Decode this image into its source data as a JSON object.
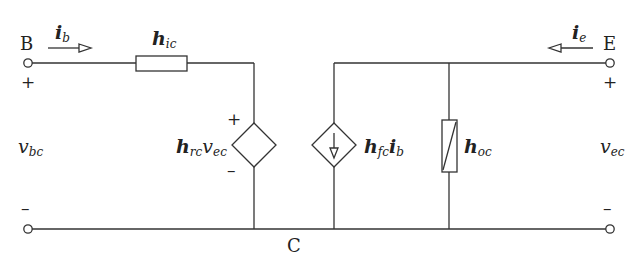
{
  "diagram": {
    "nodes": {
      "base": "B",
      "emitter": "E",
      "collector": "C"
    },
    "currents": {
      "base": {
        "symbol": "i",
        "sub": "b",
        "direction": "right"
      },
      "emitter": {
        "symbol": "i",
        "sub": "e",
        "direction": "left"
      }
    },
    "voltages": {
      "input": {
        "symbol": "v",
        "sub": "bc"
      },
      "output": {
        "symbol": "v",
        "sub": "ec"
      }
    },
    "components": {
      "input_resistance": {
        "symbol": "h",
        "sub": "ic",
        "type": "resistor"
      },
      "voltage_source": {
        "symbol": "h",
        "sub": "rc",
        "mult": "v",
        "mult_sub": "ec",
        "type": "dependent-voltage-source"
      },
      "current_source": {
        "symbol": "h",
        "sub": "fc",
        "mult": "i",
        "mult_sub": "b",
        "type": "dependent-current-source"
      },
      "output_conductance": {
        "symbol": "h",
        "sub": "oc",
        "type": "variable-resistor"
      }
    },
    "polarity": {
      "plus": "+",
      "minus": "–"
    },
    "colors": {
      "line": "#333333",
      "text": "#222222",
      "background": "#ffffff"
    }
  }
}
